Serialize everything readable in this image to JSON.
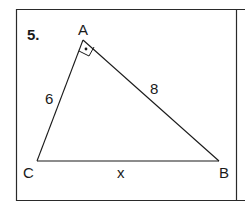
{
  "problem": {
    "number": "5.",
    "vertices": {
      "A": "A",
      "B": "B",
      "C": "C"
    },
    "sides": {
      "AC": "6",
      "AB": "8",
      "CB": "x"
    },
    "right_angle_at": "A"
  },
  "colors": {
    "stroke": "#1a1a1a",
    "background": "#ffffff"
  }
}
